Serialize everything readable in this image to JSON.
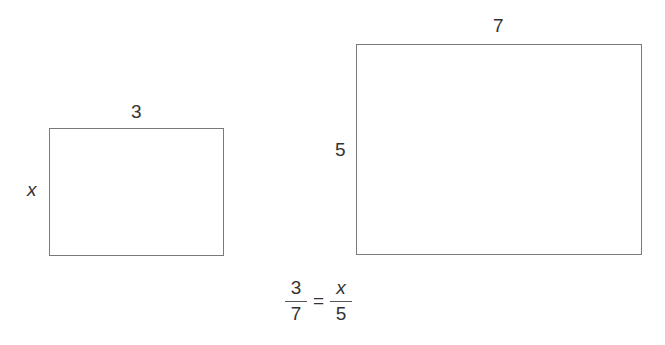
{
  "small_rectangle": {
    "top_label": "3",
    "side_label": "x"
  },
  "large_rectangle": {
    "top_label": "7",
    "side_label": "5"
  },
  "equation": {
    "left": {
      "numerator": "3",
      "denominator": "7"
    },
    "operator": "=",
    "right": {
      "numerator": "x",
      "denominator": "5"
    }
  }
}
